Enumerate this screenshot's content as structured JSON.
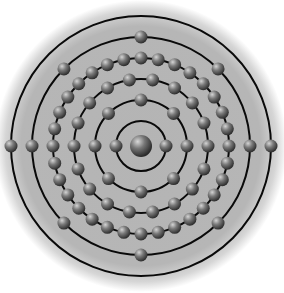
{
  "diagram": {
    "center": [
      141,
      146
    ],
    "background_radius": 146,
    "colors": {
      "background": "#ffffff",
      "disc": "#b4b4b4",
      "disc_edge": "#ffffff",
      "shell_line": "#0a0a0a",
      "electron_light": "#c8c8c8",
      "electron_dark": "#3a3a3a",
      "nucleus_light": "#d0d0d0",
      "nucleus_dark": "#2e2e2e"
    },
    "nucleus": {
      "label": "nucleus",
      "radius": 11
    },
    "electron_radius": 6.5,
    "shells": [
      {
        "label": "shell-1",
        "radius": 25,
        "electrons": 2,
        "offset_deg": 0
      },
      {
        "label": "shell-2",
        "radius": 46,
        "electrons": 8,
        "offset_deg": 0
      },
      {
        "label": "shell-3",
        "radius": 67,
        "electrons": 18,
        "offset_deg": 0
      },
      {
        "label": "shell-4",
        "radius": 88,
        "electrons": 32,
        "offset_deg": 0
      },
      {
        "label": "shell-5",
        "radius": 109,
        "electrons": 8,
        "offset_deg": 0
      },
      {
        "label": "shell-6",
        "radius": 130,
        "electrons": 2,
        "offset_deg": 0
      }
    ]
  }
}
